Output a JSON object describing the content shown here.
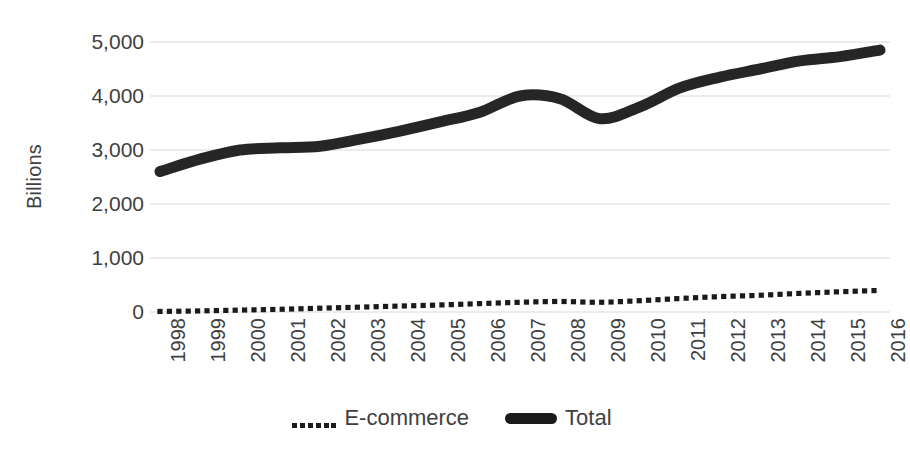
{
  "chart_data": {
    "type": "line",
    "title": "",
    "xlabel": "",
    "ylabel": "Billions",
    "x": [
      1998,
      1999,
      2000,
      2001,
      2002,
      2003,
      2004,
      2005,
      2006,
      2007,
      2008,
      2009,
      2010,
      2011,
      2012,
      2013,
      2014,
      2015,
      2016
    ],
    "categories": [
      "1998",
      "1999",
      "2000",
      "2001",
      "2002",
      "2003",
      "2004",
      "2005",
      "2006",
      "2007",
      "2008",
      "2009",
      "2010",
      "2011",
      "2012",
      "2013",
      "2014",
      "2015",
      "2016"
    ],
    "series": [
      {
        "name": "E-commerce",
        "style": "dotted",
        "color": "#1a1a1a",
        "values": [
          10,
          20,
          35,
          50,
          70,
          90,
          110,
          130,
          155,
          180,
          195,
          180,
          210,
          250,
          285,
          310,
          345,
          375,
          400
        ]
      },
      {
        "name": "Total",
        "style": "solid",
        "color": "#262626",
        "values": [
          2600,
          2830,
          3000,
          3040,
          3070,
          3200,
          3350,
          3520,
          3700,
          4000,
          3950,
          3580,
          3800,
          4150,
          4350,
          4500,
          4650,
          4730,
          4850
        ]
      }
    ],
    "ylim": [
      0,
      5000
    ],
    "yticks": [
      0,
      1000,
      2000,
      3000,
      4000,
      5000
    ],
    "ytick_labels": [
      "0",
      "1,000",
      "2,000",
      "3,000",
      "4,000",
      "5,000"
    ],
    "grid": true,
    "grid_axis": "y",
    "grid_color": "#d9d9d9",
    "legend_position": "bottom",
    "background": "#ffffff",
    "axis_text_color": "#404040"
  },
  "legend": {
    "entries": [
      {
        "label": "E-commerce",
        "marker": "dotted-line-marker"
      },
      {
        "label": "Total",
        "marker": "solid-line-marker"
      }
    ]
  }
}
